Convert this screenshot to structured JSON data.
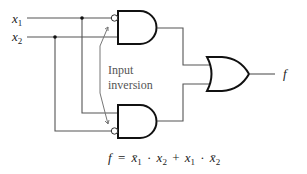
{
  "diagram": {
    "type": "logic-circuit",
    "inputs": [
      {
        "name": "x",
        "sub": "1"
      },
      {
        "name": "x",
        "sub": "2"
      }
    ],
    "gates": [
      {
        "id": "and-top",
        "type": "AND",
        "inputs": [
          "x1 (inverted)",
          "x2"
        ]
      },
      {
        "id": "and-bottom",
        "type": "AND",
        "inputs": [
          "x1",
          "x2 (inverted)"
        ]
      },
      {
        "id": "or",
        "type": "OR",
        "inputs": [
          "and-top",
          "and-bottom"
        ]
      }
    ],
    "output": {
      "name": "f"
    },
    "annotation": {
      "line1": "Input",
      "line2": "inversion"
    },
    "equation": {
      "lhs": "f",
      "equals": "=",
      "term1_a": "x̄",
      "term1_a_sub": "1",
      "dot1": "·",
      "term1_b": "x",
      "term1_b_sub": "2",
      "plus": "+",
      "term2_a": "x",
      "term2_a_sub": "1",
      "dot2": "·",
      "term2_b": "x̄",
      "term2_b_sub": "2"
    },
    "colors": {
      "wire": "#555555",
      "gate": "#111111",
      "annotation": "#555555"
    }
  }
}
